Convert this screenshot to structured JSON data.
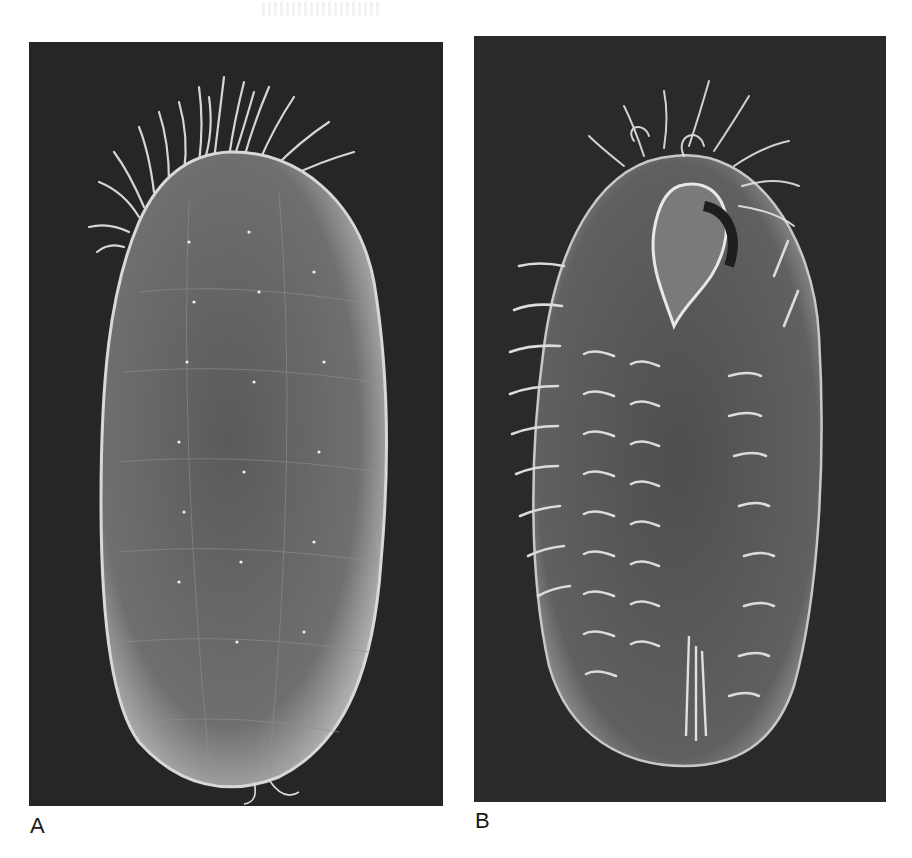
{
  "figure": {
    "panels": [
      {
        "id": "A",
        "label": "A",
        "content": "SEM micrograph of ovoid ciliate, dorsal/lateral view with oral cilia crown at top",
        "colors": {
          "background": "#262626",
          "body": "#6e6e6e",
          "cilia": "#e6e6e6"
        }
      },
      {
        "id": "B",
        "label": "B",
        "content": "SEM micrograph of ciliate, ventral view showing oral apparatus and rows of cirri",
        "colors": {
          "background": "#2a2a2a",
          "body": "#5e5e5e",
          "cilia": "#e0e0e0"
        }
      }
    ]
  }
}
